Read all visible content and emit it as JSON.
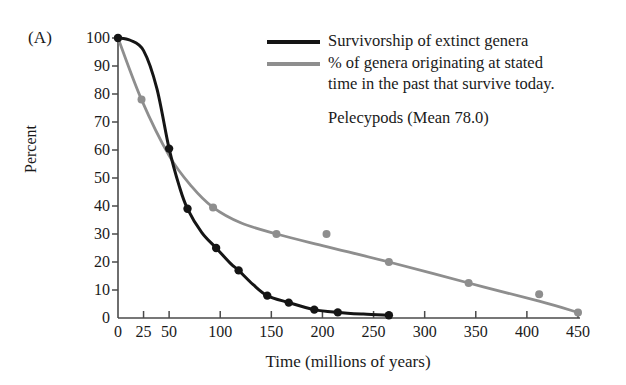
{
  "figure": {
    "panel_label": "(A)",
    "note": "Pelecypods (Mean 78.0)"
  },
  "legend": {
    "entries": [
      {
        "swatch": "black",
        "line1": "Survivorship of extinct genera",
        "line2": ""
      },
      {
        "swatch": "gray",
        "line1": "% of genera originating at stated",
        "line2": "time in the past that survive today."
      }
    ]
  },
  "colors": {
    "series_black": "#151515",
    "series_gray": "#8e8e8e",
    "axis": "#4a4a4a",
    "text": "#1a1a1a",
    "background": "#ffffff"
  },
  "chart_data": {
    "type": "line",
    "title": "",
    "subtitle": "Pelecypods (Mean 78.0)",
    "panel": "(A)",
    "xlabel": "Time (millions of years)",
    "ylabel": "Percent",
    "xlim": [
      0,
      450
    ],
    "ylim": [
      0,
      100
    ],
    "xticks": [
      0,
      25,
      50,
      100,
      150,
      200,
      250,
      300,
      350,
      400,
      450
    ],
    "xtick_labels": [
      "0",
      "25",
      "50",
      "100",
      "150",
      "200",
      "250",
      "300",
      "350",
      "400",
      "450"
    ],
    "yticks": [
      0,
      10,
      20,
      30,
      40,
      50,
      60,
      70,
      80,
      90,
      100
    ],
    "ytick_labels": [
      "0",
      "10",
      "20",
      "30",
      "40",
      "50",
      "60",
      "70",
      "80",
      "90",
      "100"
    ],
    "grid": false,
    "legend_position": "upper-right",
    "series": [
      {
        "name": "Survivorship of extinct genera",
        "color": "#151515",
        "marker": "circle",
        "points": [
          {
            "x": 0,
            "y": 100
          },
          {
            "x": 50,
            "y": 60.5
          },
          {
            "x": 68,
            "y": 39.0
          },
          {
            "x": 96,
            "y": 25.0
          },
          {
            "x": 118,
            "y": 17.0
          },
          {
            "x": 146,
            "y": 8.0
          },
          {
            "x": 167,
            "y": 5.5
          },
          {
            "x": 192,
            "y": 3.0
          },
          {
            "x": 215,
            "y": 2.0
          },
          {
            "x": 265,
            "y": 1.0
          }
        ],
        "curve": [
          {
            "x": 0,
            "y": 100
          },
          {
            "x": 12,
            "y": 99.2
          },
          {
            "x": 25,
            "y": 95.5
          },
          {
            "x": 38,
            "y": 82.0
          },
          {
            "x": 50,
            "y": 60.5
          },
          {
            "x": 60,
            "y": 47.0
          },
          {
            "x": 68,
            "y": 39.0
          },
          {
            "x": 82,
            "y": 30.5
          },
          {
            "x": 96,
            "y": 25.0
          },
          {
            "x": 110,
            "y": 19.5
          },
          {
            "x": 118,
            "y": 17.0
          },
          {
            "x": 132,
            "y": 12.0
          },
          {
            "x": 146,
            "y": 8.0
          },
          {
            "x": 167,
            "y": 5.5
          },
          {
            "x": 192,
            "y": 3.0
          },
          {
            "x": 215,
            "y": 2.0
          },
          {
            "x": 240,
            "y": 1.4
          },
          {
            "x": 265,
            "y": 1.0
          }
        ]
      },
      {
        "name": "% of genera originating at stated time in the past that survive today.",
        "color": "#8e8e8e",
        "marker": "circle",
        "points": [
          {
            "x": 0,
            "y": 100
          },
          {
            "x": 23,
            "y": 78.0
          },
          {
            "x": 93,
            "y": 39.5
          },
          {
            "x": 155,
            "y": 30.0
          },
          {
            "x": 204,
            "y": 30.0
          },
          {
            "x": 265,
            "y": 20.0
          },
          {
            "x": 343,
            "y": 12.5
          },
          {
            "x": 412,
            "y": 8.5
          },
          {
            "x": 450,
            "y": 2.0
          }
        ],
        "curve": [
          {
            "x": 0,
            "y": 100
          },
          {
            "x": 23,
            "y": 78.0
          },
          {
            "x": 50,
            "y": 58.0
          },
          {
            "x": 72,
            "y": 47.0
          },
          {
            "x": 93,
            "y": 39.5
          },
          {
            "x": 120,
            "y": 34.0
          },
          {
            "x": 155,
            "y": 30.0
          },
          {
            "x": 204,
            "y": 25.5
          },
          {
            "x": 265,
            "y": 20.0
          },
          {
            "x": 343,
            "y": 12.5
          },
          {
            "x": 412,
            "y": 6.0
          },
          {
            "x": 450,
            "y": 2.0
          }
        ]
      }
    ]
  }
}
